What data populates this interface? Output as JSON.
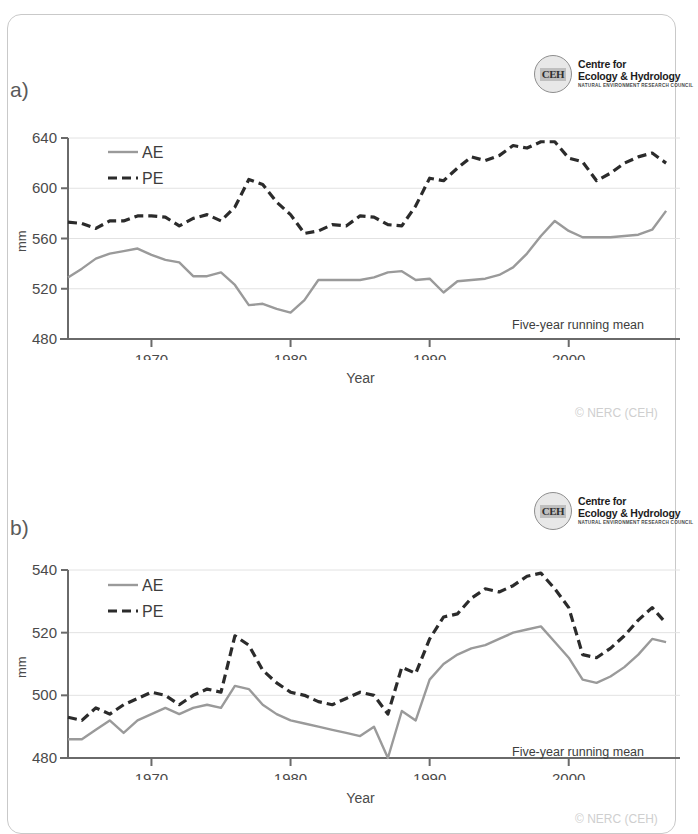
{
  "logo": {
    "mark": "CEH",
    "line1": "Centre for",
    "line2": "Ecology & Hydrology",
    "line3": "NATURAL ENVIRONMENT RESEARCH COUNCIL"
  },
  "copyright": "© NERC (CEH)",
  "panels": [
    {
      "label": "a)",
      "chart_data": {
        "type": "line",
        "title": "",
        "xlabel": "Year",
        "ylabel": "mm",
        "annotation": "Five-year running mean",
        "legend": [
          "AE",
          "PE"
        ],
        "legend_position": "top-left",
        "grid": true,
        "xlim": [
          1964,
          2008
        ],
        "ylim": [
          480,
          640
        ],
        "yticks": [
          480,
          520,
          560,
          600,
          640
        ],
        "xticks": [
          1970,
          1980,
          1990,
          2000
        ],
        "x": [
          1964,
          1965,
          1966,
          1967,
          1968,
          1969,
          1970,
          1971,
          1972,
          1973,
          1974,
          1975,
          1976,
          1977,
          1978,
          1979,
          1980,
          1981,
          1982,
          1983,
          1984,
          1985,
          1986,
          1987,
          1988,
          1989,
          1990,
          1991,
          1992,
          1993,
          1994,
          1995,
          1996,
          1997,
          1998,
          1999,
          2000,
          2001,
          2002,
          2003,
          2004,
          2005,
          2006,
          2007
        ],
        "series": [
          {
            "name": "AE",
            "color": "#9a9a9a",
            "style": "solid",
            "values": [
              529,
              536,
              544,
              548,
              550,
              552,
              547,
              543,
              541,
              530,
              530,
              533,
              523,
              507,
              508,
              504,
              501,
              511,
              527,
              527,
              527,
              527,
              529,
              533,
              534,
              527,
              528,
              517,
              526,
              527,
              528,
              531,
              537,
              548,
              562,
              574,
              566,
              561,
              561,
              561,
              562,
              563,
              567,
              582
            ]
          },
          {
            "name": "PE",
            "color": "#2b2b2b",
            "style": "dashed",
            "values": [
              573,
              572,
              568,
              574,
              574,
              578,
              578,
              577,
              570,
              576,
              579,
              574,
              585,
              607,
              603,
              589,
              579,
              564,
              566,
              571,
              570,
              578,
              577,
              571,
              570,
              586,
              608,
              606,
              616,
              625,
              622,
              626,
              634,
              632,
              637,
              637,
              624,
              621,
              606,
              612,
              620,
              625,
              628,
              620
            ]
          }
        ]
      }
    },
    {
      "label": "b)",
      "chart_data": {
        "type": "line",
        "title": "",
        "xlabel": "Year",
        "ylabel": "mm",
        "annotation": "Five-year running mean",
        "legend": [
          "AE",
          "PE"
        ],
        "legend_position": "top-left",
        "grid": true,
        "xlim": [
          1964,
          2008
        ],
        "ylim": [
          480,
          540
        ],
        "yticks": [
          480,
          500,
          520,
          540
        ],
        "xticks": [
          1970,
          1980,
          1990,
          2000
        ],
        "x": [
          1964,
          1965,
          1966,
          1967,
          1968,
          1969,
          1970,
          1971,
          1972,
          1973,
          1974,
          1975,
          1976,
          1977,
          1978,
          1979,
          1980,
          1981,
          1982,
          1983,
          1984,
          1985,
          1986,
          1987,
          1988,
          1989,
          1990,
          1991,
          1992,
          1993,
          1994,
          1995,
          1996,
          1997,
          1998,
          1999,
          2000,
          2001,
          2002,
          2003,
          2004,
          2005,
          2006,
          2007
        ],
        "series": [
          {
            "name": "AE",
            "color": "#9a9a9a",
            "style": "solid",
            "values": [
              486,
              486,
              489,
              492,
              488,
              492,
              494,
              496,
              494,
              496,
              497,
              496,
              503,
              502,
              497,
              494,
              492,
              491,
              490,
              489,
              488,
              487,
              490,
              480,
              495,
              492,
              505,
              510,
              513,
              515,
              516,
              518,
              520,
              521,
              522,
              517,
              512,
              505,
              504,
              506,
              509,
              513,
              518,
              517
            ]
          },
          {
            "name": "PE",
            "color": "#2b2b2b",
            "style": "dashed",
            "values": [
              493,
              492,
              496,
              494,
              497,
              499,
              501,
              500,
              497,
              500,
              502,
              501,
              519,
              516,
              508,
              504,
              501,
              500,
              498,
              497,
              499,
              501,
              500,
              494,
              509,
              507,
              518,
              525,
              526,
              531,
              534,
              533,
              535,
              538,
              539,
              534,
              528,
              513,
              512,
              515,
              519,
              524,
              528,
              523
            ]
          }
        ]
      }
    }
  ]
}
